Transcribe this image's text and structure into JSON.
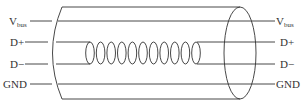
{
  "diagram": {
    "coil_count": 11,
    "left_labels": [
      {
        "main": "V",
        "sub": "bus"
      },
      {
        "main": "D+",
        "sub": ""
      },
      {
        "main": "D−",
        "sub": ""
      },
      {
        "main": "GND",
        "sub": ""
      }
    ],
    "right_labels": [
      {
        "main": "V",
        "sub": "bus"
      },
      {
        "main": "D+",
        "sub": ""
      },
      {
        "main": "D−",
        "sub": ""
      },
      {
        "main": "GND",
        "sub": ""
      }
    ],
    "line_color": "#333333"
  }
}
